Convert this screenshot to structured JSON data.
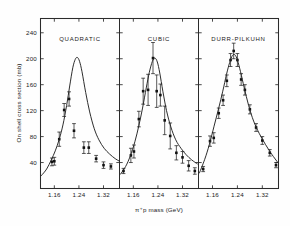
{
  "figure": {
    "background": "#fefefe",
    "ink": "#1a1a1a"
  },
  "axes": {
    "ylabel": "On shell cross section (mb)",
    "xlabel": "π⁺p mass (GeV)",
    "yticks": [
      "240",
      "200",
      "160",
      "120",
      "80",
      "40"
    ],
    "ytick_values": [
      240,
      200,
      160,
      120,
      80,
      40
    ],
    "ylim": [
      0,
      262
    ],
    "xticks": [
      "1.16",
      "1.24",
      "1.32"
    ],
    "xtick_values": [
      1.16,
      1.24,
      1.32
    ],
    "xlim": [
      1.115,
      1.372
    ],
    "grid": false
  },
  "chart_data": {
    "type": "scatter",
    "title": "",
    "subtitle": "",
    "xlabel": "π⁺p mass (GeV)",
    "ylabel": "On shell cross section (mb)",
    "xlim": [
      1.115,
      1.372
    ],
    "ylim": [
      0,
      262
    ],
    "xticks": [
      1.16,
      1.24,
      1.32
    ],
    "yticks": [
      40,
      80,
      120,
      160,
      200,
      240
    ],
    "grid": false,
    "legend": "none",
    "panels": [
      {
        "label": "QUADRATIC",
        "series": [
          {
            "name": "data",
            "type": "scatter",
            "x": [
              1.152,
              1.16,
              1.176,
              1.192,
              1.208,
              1.224,
              1.256,
              1.272,
              1.296,
              1.32,
              1.344
            ],
            "y": [
              41,
              42,
              76,
              121,
              138,
              89,
              63,
              63,
              46,
              36,
              34
            ],
            "yerr": [
              6,
              6,
              11,
              10,
              11,
              11,
              9,
              9,
              5,
              5,
              4
            ]
          },
          {
            "name": "fit",
            "type": "line",
            "x": [
              1.118,
              1.135,
              1.15,
              1.163,
              1.176,
              1.188,
              1.2,
              1.21,
              1.22,
              1.228,
              1.235,
              1.242,
              1.25,
              1.262,
              1.275,
              1.29,
              1.305,
              1.322,
              1.34,
              1.358,
              1.372
            ],
            "y": [
              20,
              30,
              44,
              58,
              76,
              98,
              128,
              158,
              186,
              199,
              202,
              196,
              180,
              148,
              118,
              92,
              75,
              62,
              53,
              46,
              42
            ]
          }
        ]
      },
      {
        "label": "CUBIC",
        "series": [
          {
            "name": "data",
            "type": "scatter",
            "x": [
              1.128,
              1.152,
              1.162,
              1.178,
              1.192,
              1.208,
              1.224,
              1.236,
              1.248,
              1.262,
              1.28,
              1.3,
              1.32,
              1.34,
              1.36
            ],
            "y": [
              27,
              51,
              57,
              107,
              150,
              152,
              201,
              150,
              144,
              105,
              81,
              55,
              48,
              35,
              27
            ],
            "yerr": [
              4,
              11,
              10,
              12,
              20,
              24,
              24,
              25,
              17,
              22,
              20,
              11,
              9,
              8,
              5
            ]
          },
          {
            "name": "fit",
            "type": "line",
            "x": [
              1.118,
              1.135,
              1.15,
              1.165,
              1.178,
              1.19,
              1.202,
              1.212,
              1.222,
              1.23,
              1.238,
              1.246,
              1.256,
              1.268,
              1.282,
              1.298,
              1.315,
              1.332,
              1.35,
              1.368
            ],
            "y": [
              22,
              34,
              50,
              72,
              97,
              124,
              155,
              179,
              196,
              201,
              195,
              178,
              150,
              120,
              95,
              75,
              62,
              52,
              44,
              38
            ]
          }
        ]
      },
      {
        "label": "DURR-PILKUHN",
        "series": [
          {
            "name": "data",
            "type": "scatter",
            "x": [
              1.13,
              1.152,
              1.164,
              1.18,
              1.194,
              1.206,
              1.218,
              1.228,
              1.24,
              1.252,
              1.264,
              1.28,
              1.3,
              1.32,
              1.344,
              1.364
            ],
            "y": [
              30,
              73,
              78,
              116,
              136,
              166,
              198,
              212,
              198,
              168,
              152,
              122,
              94,
              74,
              55,
              36
            ],
            "yerr": [
              4,
              8,
              8,
              8,
              8,
              9,
              10,
              12,
              10,
              9,
              8,
              7,
              6,
              6,
              5,
              4
            ]
          },
          {
            "name": "fit",
            "type": "line",
            "x": [
              1.118,
              1.135,
              1.15,
              1.165,
              1.18,
              1.193,
              1.205,
              1.215,
              1.224,
              1.232,
              1.24,
              1.25,
              1.262,
              1.276,
              1.292,
              1.31,
              1.33,
              1.35,
              1.37
            ],
            "y": [
              24,
              45,
              68,
              96,
              124,
              150,
              176,
              194,
              205,
              206,
              198,
              180,
              155,
              128,
              104,
              85,
              68,
              53,
              40
            ]
          }
        ]
      }
    ]
  }
}
